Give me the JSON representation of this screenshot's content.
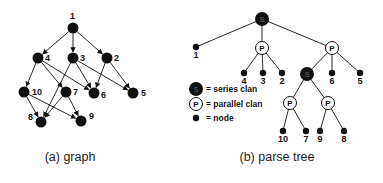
{
  "graph": {
    "caption": "(a) graph",
    "nodes": [
      {
        "id": "1",
        "x": 73,
        "y": 28,
        "lx": 70,
        "ly": 16
      },
      {
        "id": "4",
        "x": 38,
        "y": 58,
        "lx": 45,
        "ly": 58
      },
      {
        "id": "3",
        "x": 73,
        "y": 58,
        "lx": 80,
        "ly": 58
      },
      {
        "id": "2",
        "x": 107,
        "y": 58,
        "lx": 114,
        "ly": 58
      },
      {
        "id": "10",
        "x": 24,
        "y": 92,
        "lx": 32,
        "ly": 92
      },
      {
        "id": "7",
        "x": 66,
        "y": 92,
        "lx": 73,
        "ly": 92
      },
      {
        "id": "6",
        "x": 94,
        "y": 93,
        "lx": 101,
        "ly": 95
      },
      {
        "id": "5",
        "x": 133,
        "y": 93,
        "lx": 141,
        "ly": 93
      },
      {
        "id": "8",
        "x": 41,
        "y": 122,
        "lx": 28,
        "ly": 117
      },
      {
        "id": "9",
        "x": 81,
        "y": 121,
        "lx": 89,
        "ly": 116
      }
    ],
    "edges": [
      [
        "1",
        "4"
      ],
      [
        "1",
        "3"
      ],
      [
        "1",
        "2"
      ],
      [
        "4",
        "10"
      ],
      [
        "4",
        "7"
      ],
      [
        "4",
        "6"
      ],
      [
        "3",
        "8"
      ],
      [
        "3",
        "6"
      ],
      [
        "3",
        "5"
      ],
      [
        "2",
        "6"
      ],
      [
        "2",
        "5"
      ],
      [
        "10",
        "8"
      ],
      [
        "10",
        "9"
      ],
      [
        "7",
        "8"
      ],
      [
        "7",
        "9"
      ]
    ]
  },
  "tree": {
    "caption": "(b) parse tree",
    "nodes": [
      {
        "id": "root",
        "type": "series",
        "glyph": "S",
        "x": 262,
        "y": 19
      },
      {
        "id": "n1",
        "type": "node",
        "label": "1",
        "x": 196,
        "y": 47
      },
      {
        "id": "p1",
        "type": "parallel",
        "glyph": "P",
        "x": 262,
        "y": 48
      },
      {
        "id": "p2",
        "type": "parallel",
        "glyph": "P",
        "x": 332,
        "y": 48
      },
      {
        "id": "n4",
        "type": "node",
        "label": "4",
        "x": 244,
        "y": 73
      },
      {
        "id": "n3",
        "type": "node",
        "label": "3",
        "x": 263,
        "y": 73
      },
      {
        "id": "n2",
        "type": "node",
        "label": "2",
        "x": 282,
        "y": 73
      },
      {
        "id": "s2",
        "type": "series",
        "glyph": "S",
        "x": 307,
        "y": 74
      },
      {
        "id": "n6",
        "type": "node",
        "label": "6",
        "x": 332,
        "y": 73
      },
      {
        "id": "n5",
        "type": "node",
        "label": "5",
        "x": 360,
        "y": 73
      },
      {
        "id": "p3",
        "type": "parallel",
        "glyph": "P",
        "x": 290,
        "y": 103
      },
      {
        "id": "p4",
        "type": "parallel",
        "glyph": "P",
        "x": 328,
        "y": 103
      },
      {
        "id": "n10",
        "type": "node",
        "label": "10",
        "x": 283,
        "y": 131
      },
      {
        "id": "n7",
        "type": "node",
        "label": "7",
        "x": 306,
        "y": 131
      },
      {
        "id": "n9",
        "type": "node",
        "label": "9",
        "x": 320,
        "y": 131
      },
      {
        "id": "n8",
        "type": "node",
        "label": "8",
        "x": 344,
        "y": 131
      }
    ],
    "edges": [
      [
        "root",
        "n1"
      ],
      [
        "root",
        "p1"
      ],
      [
        "root",
        "p2"
      ],
      [
        "p1",
        "n4"
      ],
      [
        "p1",
        "n3"
      ],
      [
        "p1",
        "n2"
      ],
      [
        "p2",
        "s2"
      ],
      [
        "p2",
        "n6"
      ],
      [
        "p2",
        "n5"
      ],
      [
        "s2",
        "p3"
      ],
      [
        "s2",
        "p4"
      ],
      [
        "p3",
        "n10"
      ],
      [
        "p3",
        "n7"
      ],
      [
        "p4",
        "n9"
      ],
      [
        "p4",
        "n8"
      ]
    ]
  },
  "legend": {
    "items": [
      {
        "type": "series",
        "glyph": "S",
        "label": "= series clan"
      },
      {
        "type": "parallel",
        "glyph": "P",
        "label": "= parallel clan"
      },
      {
        "type": "node",
        "label": "= node"
      }
    ]
  },
  "colors": {
    "ink": "#111111",
    "background": "#ffffff"
  }
}
